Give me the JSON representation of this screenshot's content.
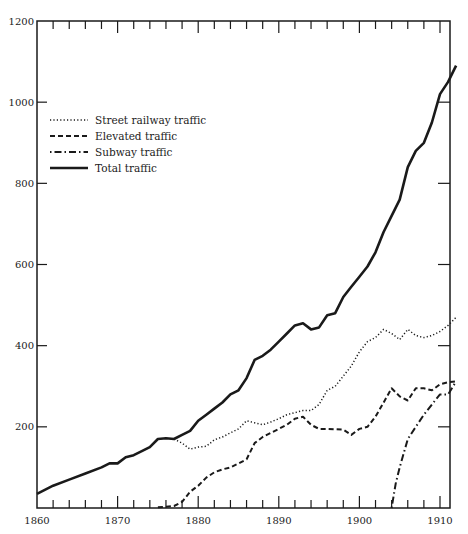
{
  "chart_data": {
    "type": "line",
    "title": "",
    "xlabel": "",
    "ylabel": "",
    "xlim": [
      1860,
      1912
    ],
    "ylim": [
      0,
      1200
    ],
    "x_ticks": [
      1860,
      1870,
      1880,
      1890,
      1900,
      1910
    ],
    "y_ticks": [
      200,
      400,
      600,
      800,
      1000,
      1200
    ],
    "x_tick_labels": [
      "1860",
      "1870",
      "1880",
      "1890",
      "1900",
      "1910"
    ],
    "y_tick_labels": [
      "200",
      "400",
      "600",
      "800",
      "1000",
      "1200"
    ],
    "grid": false,
    "legend_position": "upper left",
    "series": [
      {
        "name": "Street railway traffic",
        "style": "dotted",
        "points": [
          [
            1877,
            170
          ],
          [
            1878,
            160
          ],
          [
            1879,
            145
          ],
          [
            1880,
            150
          ],
          [
            1881,
            152
          ],
          [
            1882,
            168
          ],
          [
            1883,
            175
          ],
          [
            1884,
            185
          ],
          [
            1885,
            195
          ],
          [
            1886,
            215
          ],
          [
            1887,
            210
          ],
          [
            1888,
            205
          ],
          [
            1889,
            212
          ],
          [
            1890,
            220
          ],
          [
            1891,
            230
          ],
          [
            1892,
            235
          ],
          [
            1893,
            240
          ],
          [
            1894,
            240
          ],
          [
            1895,
            255
          ],
          [
            1896,
            290
          ],
          [
            1897,
            300
          ],
          [
            1898,
            325
          ],
          [
            1899,
            350
          ],
          [
            1900,
            385
          ],
          [
            1901,
            410
          ],
          [
            1902,
            420
          ],
          [
            1903,
            440
          ],
          [
            1904,
            430
          ],
          [
            1905,
            415
          ],
          [
            1906,
            440
          ],
          [
            1907,
            425
          ],
          [
            1908,
            420
          ],
          [
            1909,
            425
          ],
          [
            1910,
            435
          ],
          [
            1911,
            450
          ],
          [
            1912,
            470
          ]
        ]
      },
      {
        "name": "Elevated traffic",
        "style": "dashed",
        "points": [
          [
            1875,
            2
          ],
          [
            1876,
            3
          ],
          [
            1877,
            5
          ],
          [
            1878,
            15
          ],
          [
            1879,
            40
          ],
          [
            1880,
            55
          ],
          [
            1881,
            75
          ],
          [
            1882,
            88
          ],
          [
            1883,
            95
          ],
          [
            1884,
            100
          ],
          [
            1885,
            110
          ],
          [
            1886,
            120
          ],
          [
            1887,
            160
          ],
          [
            1888,
            175
          ],
          [
            1889,
            185
          ],
          [
            1890,
            195
          ],
          [
            1891,
            205
          ],
          [
            1892,
            220
          ],
          [
            1893,
            225
          ],
          [
            1894,
            205
          ],
          [
            1895,
            195
          ],
          [
            1896,
            195
          ],
          [
            1897,
            194
          ],
          [
            1898,
            193
          ],
          [
            1899,
            180
          ],
          [
            1900,
            195
          ],
          [
            1901,
            200
          ],
          [
            1902,
            225
          ],
          [
            1903,
            260
          ],
          [
            1904,
            295
          ],
          [
            1905,
            275
          ],
          [
            1906,
            265
          ],
          [
            1907,
            295
          ],
          [
            1908,
            295
          ],
          [
            1909,
            290
          ],
          [
            1910,
            305
          ],
          [
            1911,
            310
          ],
          [
            1912,
            312
          ]
        ]
      },
      {
        "name": "Subway traffic",
        "style": "dash-dot",
        "points": [
          [
            1904,
            0
          ],
          [
            1904.5,
            60
          ],
          [
            1905,
            100
          ],
          [
            1906,
            170
          ],
          [
            1907,
            200
          ],
          [
            1908,
            230
          ],
          [
            1909,
            255
          ],
          [
            1910,
            280
          ],
          [
            1911,
            280
          ],
          [
            1912,
            312
          ]
        ]
      },
      {
        "name": "Total traffic",
        "style": "solid",
        "points": [
          [
            1860,
            35
          ],
          [
            1862,
            55
          ],
          [
            1864,
            70
          ],
          [
            1866,
            85
          ],
          [
            1868,
            100
          ],
          [
            1869,
            110
          ],
          [
            1870,
            110
          ],
          [
            1871,
            125
          ],
          [
            1872,
            130
          ],
          [
            1873,
            140
          ],
          [
            1874,
            150
          ],
          [
            1875,
            170
          ],
          [
            1876,
            172
          ],
          [
            1877,
            170
          ],
          [
            1878,
            180
          ],
          [
            1879,
            190
          ],
          [
            1880,
            215
          ],
          [
            1881,
            230
          ],
          [
            1882,
            245
          ],
          [
            1883,
            260
          ],
          [
            1884,
            280
          ],
          [
            1885,
            290
          ],
          [
            1886,
            320
          ],
          [
            1887,
            365
          ],
          [
            1888,
            375
          ],
          [
            1889,
            390
          ],
          [
            1890,
            410
          ],
          [
            1891,
            430
          ],
          [
            1892,
            450
          ],
          [
            1893,
            455
          ],
          [
            1894,
            440
          ],
          [
            1895,
            445
          ],
          [
            1896,
            475
          ],
          [
            1897,
            480
          ],
          [
            1898,
            520
          ],
          [
            1899,
            545
          ],
          [
            1900,
            570
          ],
          [
            1901,
            595
          ],
          [
            1902,
            630
          ],
          [
            1903,
            680
          ],
          [
            1904,
            720
          ],
          [
            1905,
            760
          ],
          [
            1906,
            840
          ],
          [
            1907,
            880
          ],
          [
            1908,
            900
          ],
          [
            1909,
            950
          ],
          [
            1910,
            1020
          ],
          [
            1911,
            1050
          ],
          [
            1912,
            1090
          ]
        ]
      }
    ]
  },
  "legend": {
    "items": [
      {
        "label": "Street railway traffic"
      },
      {
        "label": "Elevated traffic"
      },
      {
        "label": "Subway traffic"
      },
      {
        "label": "Total traffic"
      }
    ]
  },
  "colors": {
    "line": "#1a1a1a",
    "background": "#ffffff"
  }
}
